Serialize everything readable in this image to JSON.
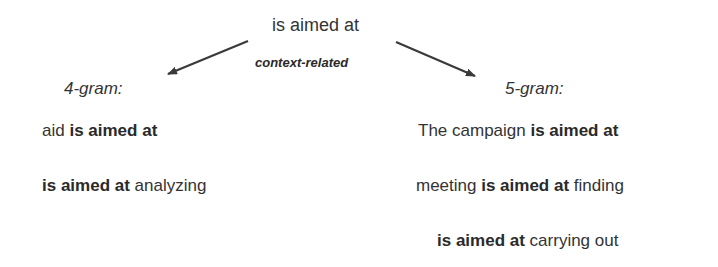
{
  "diagram": {
    "root": "is aimed at",
    "relation_label": "context-related",
    "branches": [
      {
        "header": "4-gram:",
        "items": [
          {
            "pre": "aid ",
            "bold": "is aimed at",
            "post": ""
          },
          {
            "pre": "",
            "bold": "is aimed at",
            "post": " analyzing"
          }
        ]
      },
      {
        "header": "5-gram:",
        "items": [
          {
            "pre": "The campaign ",
            "bold": "is aimed at",
            "post": ""
          },
          {
            "pre": "meeting ",
            "bold": "is aimed at",
            "post": " finding"
          },
          {
            "pre": "",
            "bold": "is aimed at",
            "post": " carrying out"
          }
        ]
      }
    ],
    "colors": {
      "text": "#333333",
      "arrow": "#3a3a3a"
    }
  }
}
